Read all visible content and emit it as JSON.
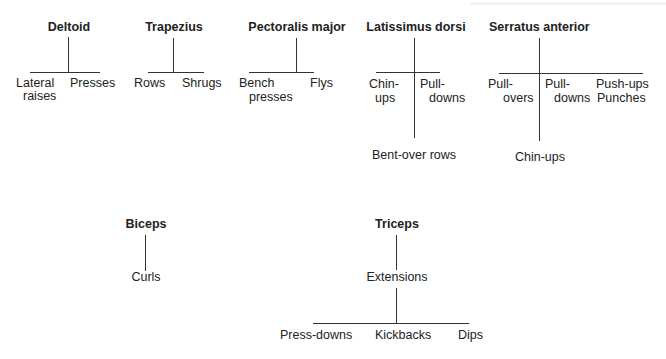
{
  "diagrams": [
    {
      "muscle": "Deltoid",
      "exercises": [
        "Lateral raises",
        "Presses"
      ]
    },
    {
      "muscle": "Trapezius",
      "exercises": [
        "Rows",
        "Shrugs"
      ]
    },
    {
      "muscle": "Pectoralis major",
      "exercises": [
        "Bench presses",
        "Flys"
      ]
    },
    {
      "muscle": "Latissimus dorsi",
      "exercises": [
        "Chin-ups",
        "Pull-downs",
        "Bent-over rows"
      ]
    },
    {
      "muscle": "Serratus anterior",
      "exercises": [
        "Pull-overs",
        "Pull-downs",
        "Push-ups",
        "Punches",
        "Chin-ups"
      ]
    },
    {
      "muscle": "Biceps",
      "exercises": [
        "Curls"
      ]
    },
    {
      "muscle": "Triceps",
      "exercises": [
        "Extensions",
        "Press-downs",
        "Kickbacks",
        "Dips"
      ]
    }
  ],
  "labels": {
    "deltoid": {
      "title": "Deltoid",
      "left1": "Lateral",
      "left2": "raises",
      "right": "Presses"
    },
    "trapezius": {
      "title": "Trapezius",
      "left": "Rows",
      "right": "Shrugs"
    },
    "pectoralis": {
      "title": "Pectoralis major",
      "left1": "Bench",
      "left2": "presses",
      "right": "Flys"
    },
    "latissimus": {
      "title": "Latissimus dorsi",
      "left1": "Chin-",
      "left2": "ups",
      "right1": "Pull-",
      "right2": "downs",
      "bottom": "Bent-over rows"
    },
    "serratus": {
      "title": "Serratus anterior",
      "a1": "Pull-",
      "a2": "overs",
      "b1": "Pull-",
      "b2": "downs",
      "c1": "Push-ups",
      "c2": "Punches",
      "bottom": "Chin-ups"
    },
    "biceps": {
      "title": "Biceps",
      "child": "Curls"
    },
    "triceps": {
      "title": "Triceps",
      "mid": "Extensions",
      "c1": "Press-downs",
      "c2": "Kickbacks",
      "c3": "Dips"
    }
  }
}
